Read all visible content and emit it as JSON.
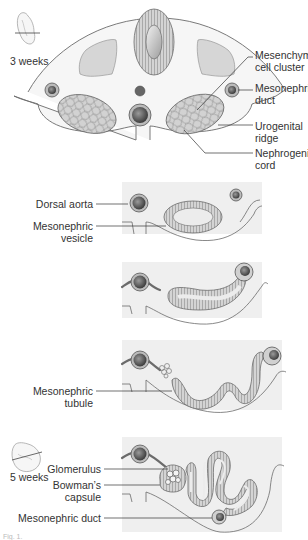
{
  "figure": {
    "caption_fragment": "Fig. 1.",
    "colors": {
      "outline": "#6b6b6b",
      "tissue_fill": "#f4f4f4",
      "panel_bg": "#eeeeee",
      "somite_fill": "#d6d6d6",
      "vessel_dark": "#555555",
      "tubule_fill": "#cfcfcf",
      "lumen_fill": "#ececec",
      "label_text": "#333333"
    }
  },
  "stages": [
    {
      "id": "stage-1",
      "age_label": "3 weeks",
      "labels": [
        {
          "line1": "Mesenchymal",
          "line2": "cell cluster"
        },
        {
          "line1": "Mesonephric",
          "line2": "duct"
        },
        {
          "line1": "Urogenital",
          "line2": "ridge"
        },
        {
          "line1": "Nephrogenic",
          "line2": "cord"
        }
      ]
    },
    {
      "id": "stage-2",
      "labels": [
        {
          "line1": "Dorsal aorta"
        },
        {
          "line1": "Mesonephric",
          "line2": "vesicle"
        }
      ]
    },
    {
      "id": "stage-3",
      "labels": []
    },
    {
      "id": "stage-4",
      "labels": [
        {
          "line1": "Mesonephric",
          "line2": "tubule"
        }
      ]
    },
    {
      "id": "stage-5",
      "age_label": "5 weeks",
      "labels": [
        {
          "line1": "Glomerulus"
        },
        {
          "line1": "Bowman’s",
          "line2": "capsule"
        },
        {
          "line1": "Mesonephric duct"
        }
      ]
    }
  ]
}
